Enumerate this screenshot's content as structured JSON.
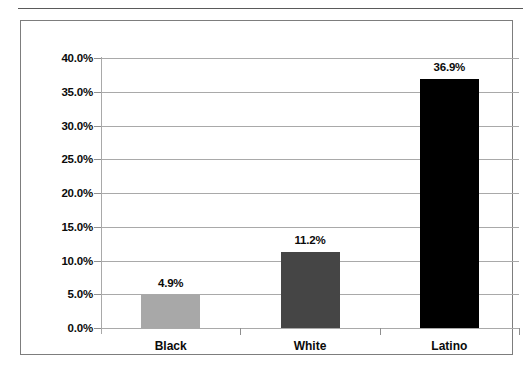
{
  "chart_data": {
    "type": "bar",
    "title": "",
    "subtitle": "",
    "xlabel": "",
    "ylabel": "",
    "categories": [
      "Black",
      "White",
      "Latino"
    ],
    "values": [
      4.9,
      11.2,
      36.9
    ],
    "data_labels": [
      "4.9%",
      "11.2%",
      "36.9%"
    ],
    "series": [
      {
        "name": "",
        "values": [
          4.9,
          11.2,
          36.9
        ]
      }
    ],
    "ylim": [
      0,
      40
    ],
    "y_tick_values": [
      40.0,
      35.0,
      30.0,
      25.0,
      20.0,
      15.0,
      10.0,
      5.0,
      0.0
    ],
    "y_tick_labels": [
      "40.0%",
      "35.0%",
      "30.0%",
      "25.0%",
      "20.0%",
      "15.0%",
      "10.0%",
      "5.0%",
      "0.0%"
    ],
    "grid": true,
    "legend": "none",
    "units": "percent",
    "bar_colors": [
      "#a8a8a8",
      "#454545",
      "#000000"
    ],
    "gridline_color": "#a9a9a9",
    "axis_color": "#8f8f8f",
    "frame_color": "#7d7d7d",
    "text_color": "#0b0b0b",
    "background": "#ffffff"
  }
}
